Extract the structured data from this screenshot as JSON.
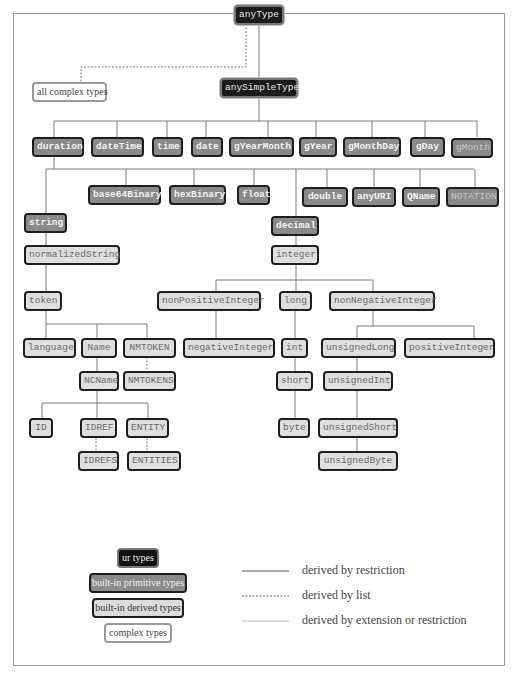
{
  "diagram": {
    "nodes": {
      "anyType": "anyType",
      "all_complex_types": "all complex types",
      "anySimpleType": "anySimpleType",
      "duration": "duration",
      "dateTime": "dateTime",
      "time": "time",
      "date": "date",
      "gYearMonth": "gYearMonth",
      "gYear": "gYear",
      "gMonthDay": "gMonthDay",
      "gDay": "gDay",
      "gMonth": "gMonth",
      "base64Binary": "base64Binary",
      "hexBinary": "hexBinary",
      "float": "float",
      "double": "double",
      "anyURI": "anyURI",
      "QName": "QName",
      "NOTATION": "NOTATION",
      "string": "string",
      "decimal": "decimal",
      "normalizedString": "normalizedString",
      "integer": "integer",
      "token": "token",
      "nonPositiveInteger": "nonPositiveInteger",
      "long": "long",
      "nonNegativeInteger": "nonNegativeInteger",
      "language": "language",
      "Name": "Name",
      "NMTOKEN": "NMTOKEN",
      "negativeInteger": "negativeInteger",
      "int": "int",
      "unsignedLong": "unsignedLong",
      "positiveInteger": "positiveInteger",
      "NCName": "NCName",
      "NMTOKENS": "NMTOKENS",
      "short": "short",
      "unsignedInt": "unsignedInt",
      "ID": "ID",
      "IDREF": "IDREF",
      "ENTITY": "ENTITY",
      "byte": "byte",
      "unsignedShort": "unsignedShort",
      "IDREFS": "IDREFS",
      "ENTITIES": "ENTITIES",
      "unsignedByte": "unsignedByte"
    },
    "legend": {
      "boxes": {
        "ur_types": "ur types",
        "primitive": "built-in primitive types",
        "derived": "built-in derived types",
        "complex": "complex types"
      },
      "lines": {
        "restriction": "derived by restriction",
        "list": "derived by list",
        "extension": "derived by extension or restriction"
      }
    },
    "colors": {
      "ur_fill": "#1b1b1b",
      "primitive_fill": "#8a8a8a",
      "derived_fill": "#dedede",
      "complex_fill": "#ffffff",
      "line": "#777777"
    }
  }
}
